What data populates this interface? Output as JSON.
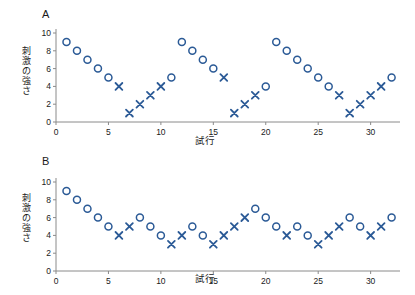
{
  "figure": {
    "panels": [
      {
        "letter": "A",
        "ylabel": "刺激の強さ",
        "xlabel": "試行"
      },
      {
        "letter": "B",
        "ylabel": "刺激の強さ",
        "xlabel": "試行"
      }
    ],
    "marker_color": "#2b5a96",
    "axis_color": "#8a8a8a",
    "text_color": "#1a1a1a"
  },
  "chart_data": [
    {
      "type": "scatter",
      "panel": "A",
      "title": "",
      "xlabel": "試行",
      "ylabel": "刺激の強さ",
      "xlim": [
        0,
        32.8
      ],
      "ylim": [
        0,
        10
      ],
      "xticks": [
        0,
        5,
        10,
        15,
        20,
        25,
        30
      ],
      "yticks": [
        0,
        2,
        4,
        6,
        8,
        10
      ],
      "xticklabels": [
        "0",
        "5",
        "10",
        "15",
        "20",
        "25",
        "30"
      ],
      "yticklabels": [
        "0",
        "2",
        "4",
        "6",
        "8",
        "10"
      ],
      "grid": false,
      "legend": false,
      "series": [
        {
          "name": "circle",
          "marker": "o",
          "x": [
            1,
            2,
            3,
            4,
            5,
            11,
            12,
            13,
            14,
            15,
            20,
            21,
            22,
            23,
            24,
            25,
            26,
            32
          ],
          "y": [
            9,
            8,
            7,
            6,
            5,
            5,
            9,
            8,
            7,
            6,
            4,
            9,
            8,
            7,
            6,
            5,
            4,
            5
          ]
        },
        {
          "name": "cross",
          "marker": "x",
          "x": [
            6,
            7,
            8,
            9,
            10,
            16,
            17,
            18,
            19,
            27,
            28,
            29,
            30,
            31
          ],
          "y": [
            4,
            1,
            2,
            3,
            4,
            5,
            1,
            2,
            3,
            3,
            1,
            2,
            3,
            4
          ]
        }
      ]
    },
    {
      "type": "scatter",
      "panel": "B",
      "title": "",
      "xlabel": "試行",
      "ylabel": "刺激の強さ",
      "xlim": [
        0,
        32.8
      ],
      "ylim": [
        0,
        10
      ],
      "xticks": [
        0,
        5,
        10,
        15,
        20,
        25,
        30
      ],
      "yticks": [
        0,
        2,
        4,
        6,
        8,
        10
      ],
      "xticklabels": [
        "0",
        "5",
        "10",
        "15",
        "20",
        "25",
        "30"
      ],
      "yticklabels": [
        "0",
        "2",
        "4",
        "6",
        "8",
        "10"
      ],
      "grid": false,
      "legend": false,
      "series": [
        {
          "name": "circle",
          "marker": "o",
          "x": [
            1,
            2,
            3,
            4,
            5,
            8,
            9,
            10,
            13,
            14,
            19,
            20,
            21,
            23,
            24,
            28,
            29,
            32
          ],
          "y": [
            9,
            8,
            7,
            6,
            5,
            6,
            5,
            4,
            5,
            4,
            7,
            6,
            5,
            5,
            4,
            6,
            5,
            6
          ]
        },
        {
          "name": "cross",
          "marker": "x",
          "x": [
            6,
            7,
            11,
            12,
            15,
            16,
            17,
            18,
            22,
            25,
            26,
            27,
            30,
            31
          ],
          "y": [
            4,
            5,
            3,
            4,
            3,
            4,
            5,
            6,
            4,
            3,
            4,
            5,
            4,
            5
          ]
        }
      ]
    }
  ]
}
